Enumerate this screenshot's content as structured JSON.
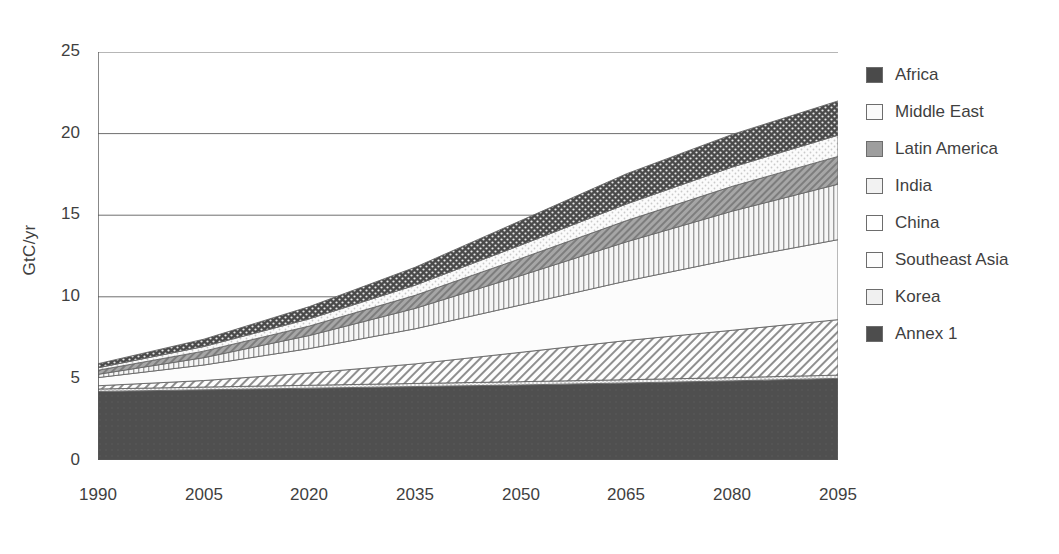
{
  "chart_data": {
    "type": "area",
    "title": "",
    "xlabel": "",
    "ylabel": "GtC/yr",
    "x": [
      1990,
      2005,
      2020,
      2035,
      2050,
      2065,
      2080,
      2095
    ],
    "xticklabels": [
      "1990",
      "2005",
      "2020",
      "2035",
      "2050",
      "2065",
      "2080",
      "2095"
    ],
    "yticklabels": [
      "0",
      "5",
      "10",
      "15",
      "20",
      "25"
    ],
    "yticks": [
      0,
      5,
      10,
      15,
      20,
      25
    ],
    "ylim": [
      0,
      25
    ],
    "xlim": [
      1990,
      2095
    ],
    "grid": "horizontal",
    "legend_position": "right",
    "stacked": true,
    "stack_order_bottom_to_top": [
      "Annex 1",
      "Korea",
      "Southeast Asia",
      "China",
      "India",
      "Latin America",
      "Middle East",
      "Africa"
    ],
    "series": [
      {
        "name": "Annex 1",
        "values": [
          4.2,
          4.3,
          4.4,
          4.5,
          4.6,
          4.72,
          4.85,
          5.0
        ]
      },
      {
        "name": "Korea",
        "values": [
          0.15,
          0.17,
          0.18,
          0.19,
          0.2,
          0.2,
          0.2,
          0.2
        ]
      },
      {
        "name": "Southeast Asia",
        "values": [
          0.2,
          0.4,
          0.75,
          1.2,
          1.8,
          2.4,
          2.9,
          3.4
        ]
      },
      {
        "name": "China",
        "values": [
          0.5,
          0.95,
          1.5,
          2.15,
          2.9,
          3.65,
          4.35,
          4.9
        ]
      },
      {
        "name": "India",
        "values": [
          0.2,
          0.45,
          0.8,
          1.25,
          1.8,
          2.4,
          2.95,
          3.4
        ]
      },
      {
        "name": "Latin America",
        "values": [
          0.25,
          0.4,
          0.58,
          0.8,
          1.05,
          1.3,
          1.52,
          1.7
        ]
      },
      {
        "name": "Middle East",
        "values": [
          0.15,
          0.28,
          0.44,
          0.62,
          0.82,
          1.02,
          1.18,
          1.3
        ]
      },
      {
        "name": "Africa",
        "values": [
          0.25,
          0.45,
          0.75,
          1.1,
          1.5,
          1.85,
          2.0,
          2.1
        ]
      }
    ],
    "cumulative_tops": {
      "Annex 1": [
        4.2,
        4.3,
        4.4,
        4.5,
        4.6,
        4.72,
        4.85,
        5.0
      ],
      "Korea": [
        4.35,
        4.47,
        4.58,
        4.69,
        4.8,
        4.92,
        5.05,
        5.2
      ],
      "Southeast Asia": [
        4.55,
        4.87,
        5.33,
        5.89,
        6.6,
        7.32,
        7.95,
        8.6
      ],
      "China": [
        5.05,
        5.82,
        6.83,
        8.04,
        9.5,
        10.97,
        12.3,
        13.5
      ],
      "India": [
        5.25,
        6.27,
        7.63,
        9.29,
        11.3,
        13.37,
        15.25,
        16.9
      ],
      "Latin America": [
        5.5,
        6.67,
        8.21,
        10.09,
        12.35,
        14.67,
        16.77,
        18.6
      ],
      "Middle East": [
        5.65,
        6.95,
        8.65,
        10.71,
        13.17,
        15.69,
        17.95,
        19.9
      ],
      "Africa": [
        5.9,
        7.4,
        9.4,
        11.81,
        14.67,
        17.54,
        19.95,
        22.0
      ]
    }
  },
  "legend": {
    "items": [
      {
        "label": "Africa",
        "swatch": "dotted-dark-swatch"
      },
      {
        "label": "Middle East",
        "swatch": "dotted-light-swatch"
      },
      {
        "label": "Latin America",
        "swatch": "diagonal-gray-swatch"
      },
      {
        "label": "India",
        "swatch": "vertical-lines-swatch"
      },
      {
        "label": "China",
        "swatch": "plain-white-swatch"
      },
      {
        "label": "Southeast Asia",
        "swatch": "diagonal-white-swatch"
      },
      {
        "label": "Korea",
        "swatch": "stipple-light-swatch"
      },
      {
        "label": "Annex 1",
        "swatch": "solid-dark-swatch"
      }
    ]
  },
  "colors": {
    "africa": "#4a4a4a",
    "middle_east": "#fafafa",
    "latin_america": "#9e9e9e",
    "india": "#f2f2f2",
    "china": "#ffffff",
    "southeast_asia": "#fdfdfd",
    "korea": "#f0f0f0",
    "annex_1": "#4d4d4d",
    "axis": "#555555",
    "text": "#3f3f3f"
  }
}
